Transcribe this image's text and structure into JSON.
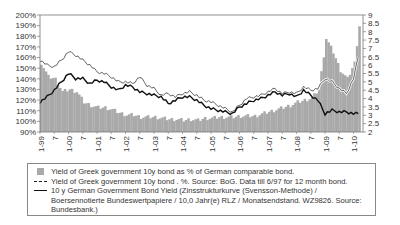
{
  "chart_data": {
    "type": "bar+line",
    "title": "",
    "x_tick_labels": [
      "1-99",
      "7",
      "1-00",
      "7",
      "1-01",
      "7",
      "1-02",
      "7",
      "1-03",
      "7",
      "1-04",
      "7",
      "1-05",
      "7",
      "1-06",
      "7",
      "1-07",
      "7",
      "1-08",
      "7",
      "1-09",
      "7",
      "1-10"
    ],
    "left_axis": {
      "label": "",
      "ticks": [
        "200%",
        "190%",
        "180%",
        "170%",
        "160%",
        "150%",
        "140%",
        "130%",
        "120%",
        "110%",
        "100%",
        "90%"
      ],
      "range": [
        90,
        200
      ]
    },
    "right_axis": {
      "label": "",
      "ticks": [
        "9",
        "8.5",
        "8",
        "7.5",
        "7",
        "6.5",
        "6",
        "5.5",
        "5",
        "4.5",
        "4",
        "3.5",
        "3",
        "2.5",
        "2"
      ],
      "range": [
        2,
        9
      ]
    },
    "x_months": [
      0,
      3,
      6,
      9,
      12,
      15,
      18,
      21,
      24,
      27,
      30,
      33,
      36,
      39,
      42,
      45,
      48,
      51,
      54,
      57,
      60,
      63,
      66,
      69,
      72,
      75,
      78,
      81,
      84,
      87,
      90,
      93,
      96,
      99,
      102,
      105,
      108,
      111,
      114,
      117,
      120,
      123,
      126,
      129,
      132,
      134
    ],
    "series": [
      {
        "name": "Yield of Greek government 10y bond as % of German comparable bond.",
        "type": "bar",
        "axis": "left",
        "color": "#a9a9a9",
        "values": [
          155,
          142,
          140,
          128,
          130,
          128,
          118,
          115,
          113,
          113,
          111,
          108,
          106,
          106,
          104,
          104,
          104,
          103,
          102,
          102,
          101,
          102,
          101,
          103,
          103,
          104,
          104,
          104,
          105,
          105,
          105,
          107,
          109,
          111,
          113,
          115,
          118,
          120,
          122,
          130,
          178,
          165,
          148,
          140,
          155,
          190
        ]
      },
      {
        "name": "Yield of Greek government 10y bond . %. Source: BoG. Data till 6/97 for 12 month bond.",
        "type": "line",
        "axis": "right",
        "color": "#222222",
        "values": [
          6.3,
          6.0,
          5.9,
          6.3,
          6.8,
          6.6,
          6.3,
          6.0,
          5.6,
          5.5,
          5.3,
          5.0,
          5.0,
          4.9,
          5.3,
          4.8,
          4.6,
          4.2,
          4.3,
          4.1,
          4.3,
          4.4,
          4.2,
          3.9,
          3.8,
          3.6,
          3.4,
          3.2,
          3.6,
          4.0,
          4.1,
          4.2,
          4.4,
          4.6,
          4.3,
          4.4,
          4.3,
          4.7,
          4.5,
          4.6,
          5.2,
          5.0,
          4.6,
          4.3,
          5.2,
          6.5
        ]
      },
      {
        "name": "10 y German Government Bond Yield (Zinsstrukturkurve (Svensson-Methode) / Boersennotierte Bundeswertpapiere / 10,0 Jahr(e) RLZ / Monatsendstand. WZ9826. Source: Bundesbank.)",
        "type": "line",
        "axis": "right",
        "color": "#111111",
        "values": [
          3.8,
          4.1,
          4.5,
          5.0,
          5.5,
          5.2,
          5.2,
          4.9,
          5.1,
          5.0,
          4.7,
          4.5,
          4.8,
          4.7,
          4.4,
          4.3,
          4.2,
          4.1,
          3.7,
          3.9,
          4.1,
          4.1,
          3.9,
          3.6,
          3.4,
          3.3,
          3.2,
          3.1,
          3.5,
          3.7,
          3.9,
          4.0,
          4.2,
          4.4,
          4.2,
          4.3,
          4.1,
          4.5,
          4.2,
          3.9,
          3.1,
          3.3,
          3.2,
          3.2,
          3.1,
          3.1
        ]
      }
    ],
    "legend_position": "bottom",
    "grid": false
  },
  "legend": {
    "items": [
      {
        "label": "Yield of Greek government 10y bond as % of German comparable bond.",
        "icon": "gray-square"
      },
      {
        "label": "Yield of Greek government 10y bond . %. Source: BoG. Data till 6/97 for 12 month bond.",
        "icon": "dashed-line"
      },
      {
        "label": "10 y German Government Bond Yield (Zinsstrukturkurve (Svensson-Methode) / Boersennotierte Bundeswertpapiere / 10,0 Jahr(e) RLZ / Monatsendstand. WZ9826. Source: Bundesbank.)",
        "icon": "solid-line"
      }
    ]
  }
}
